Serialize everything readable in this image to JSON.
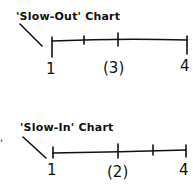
{
  "charts": [
    {
      "title": "'Slow-Out' Chart",
      "labels": {
        "start": "1",
        "middle": "(3)",
        "end": "4"
      }
    },
    {
      "title": "'Slow-In' Chart",
      "labels": {
        "start": "1",
        "middle": "(2)",
        "end": "4"
      }
    }
  ],
  "edge_text": ",",
  "colors": {
    "ink": "#111111",
    "background": "#ffffff"
  }
}
